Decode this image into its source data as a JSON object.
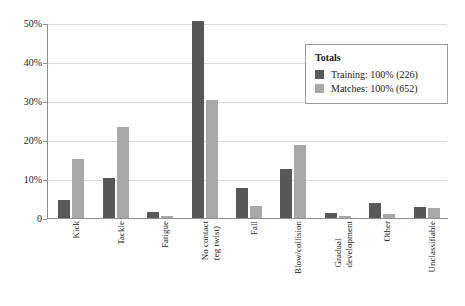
{
  "chart_data": {
    "type": "bar",
    "title": "",
    "subtitle": "",
    "xlabel": "",
    "ylabel": "",
    "ylim": [
      0,
      50
    ],
    "grid": true,
    "legend_position": "top-right",
    "ytick_labels": [
      "0",
      "10%",
      "20%",
      "30%",
      "40%",
      "50%"
    ],
    "ytick_values": [
      0,
      10,
      20,
      30,
      40,
      50
    ],
    "categories": [
      "Kick",
      "Tackle",
      "Fatigue",
      "No contact (eg twist)",
      "Fall",
      "Blow/collision",
      "Gradual development",
      "Other",
      "Unclassifiable"
    ],
    "category_lines": [
      [
        "Kick"
      ],
      [
        "Tackle"
      ],
      [
        "Fatigue"
      ],
      [
        "No contact",
        "(eg twist)"
      ],
      [
        "Fall"
      ],
      [
        "Blow/collision"
      ],
      [
        "Gradual",
        "development"
      ],
      [
        "Other"
      ],
      [
        "Unclassifiable"
      ]
    ],
    "series": [
      {
        "name": "Training",
        "legend_label": "Training: 100% (226)",
        "color": "#58585a",
        "values": [
          5.0,
          10.6,
          1.8,
          50.7,
          7.9,
          12.7,
          1.5,
          4.2,
          3.2
        ]
      },
      {
        "name": "Matches",
        "legend_label": "Matches: 100% (652)",
        "color": "#a8a8a8",
        "values": [
          15.5,
          23.7,
          0.9,
          30.5,
          3.3,
          19.0,
          0.8,
          1.3,
          2.8
        ]
      }
    ]
  },
  "legend": {
    "title": "Totals",
    "entries": [
      {
        "label": "Training: 100% (226)",
        "color": "#58585a"
      },
      {
        "label": "Matches: 100% (652)",
        "color": "#a8a8a8"
      }
    ]
  },
  "colors": {
    "training": "#58585a",
    "matches": "#a8a8a8",
    "axis": "#8e8e8e",
    "grid": "#d9d9d9",
    "legend_border": "#9a9a9a",
    "background": "#ffffff",
    "text": "#1a1a1a"
  }
}
